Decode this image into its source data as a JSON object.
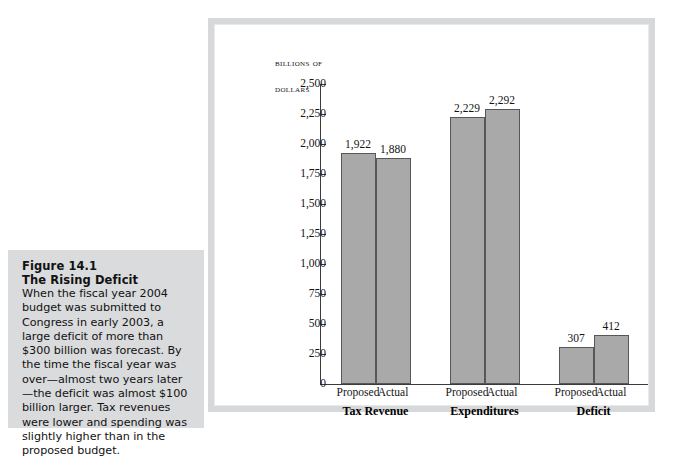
{
  "figure": {
    "number": "Figure 14.1",
    "title": "The Rising Deficit",
    "caption": "When the fiscal year 2004 budget was submitted to Congress in early 2003, a large deficit of more than $300 billion was forecast. By the time the fiscal year was over—almost two years later—the deficit was almost $100 billion larger. Tax revenues were lower and spending was slightly higher than in the proposed budget."
  },
  "chart_data": {
    "type": "bar",
    "title": "",
    "axis_title_lines": [
      "Billions of",
      "Dollars"
    ],
    "ylabel": "Billions of Dollars",
    "xlabel": "",
    "ylim": [
      0,
      2500
    ],
    "ytick_values": [
      0,
      250,
      500,
      750,
      1000,
      1250,
      1500,
      1750,
      2000,
      2250,
      2500
    ],
    "ytick_labels": [
      "0",
      "250",
      "500",
      "750",
      "1,000",
      "1,250",
      "1,500",
      "1,750",
      "2,000",
      "2,250",
      "2,500"
    ],
    "grid": false,
    "legend": "none",
    "categories": [
      "Tax Revenue",
      "Expenditures",
      "Deficit"
    ],
    "series": [
      {
        "name": "Proposed",
        "values": [
          1922,
          2229,
          307
        ],
        "labels": [
          "1,922",
          "2,229",
          "307"
        ]
      },
      {
        "name": "Actual",
        "values": [
          1880,
          2292,
          412
        ],
        "labels": [
          "1,880",
          "2,292",
          "412"
        ]
      }
    ],
    "bar_color": "#a9a9a9",
    "bar_edge_color": "#575757",
    "axis_color": "#3b3b3b"
  },
  "page_bleed": ""
}
